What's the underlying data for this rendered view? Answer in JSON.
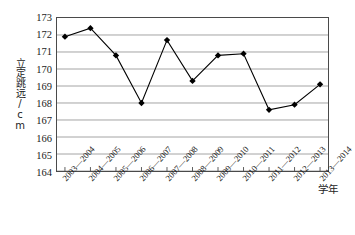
{
  "chart_data": {
    "type": "line",
    "title": "",
    "subtitle": "",
    "xlabel": "学年",
    "ylabel": "立定跳远/cm",
    "categories": [
      "2003—2004",
      "2004—2005",
      "2005—2006",
      "2006—2007",
      "2007—2008",
      "2008—2009",
      "2009—2010",
      "2010—2011",
      "2011—2012",
      "2012—2013",
      "2013—2014"
    ],
    "values": [
      171.9,
      172.4,
      170.8,
      168.0,
      171.7,
      169.3,
      170.8,
      170.9,
      167.6,
      167.9,
      169.1
    ],
    "ylim": [
      164,
      173
    ],
    "ytick_labels": [
      "173",
      "172",
      "171",
      "170",
      "169",
      "168",
      "167",
      "166",
      "165",
      "164"
    ],
    "yticks": [
      173,
      172,
      171,
      170,
      169,
      168,
      167,
      166,
      165,
      164
    ],
    "grid": "horizontal",
    "legend": "none",
    "series_color": "#000000",
    "gridline_color": "#999999",
    "axis_color": "#4a4a4a",
    "marker": "diamond"
  }
}
